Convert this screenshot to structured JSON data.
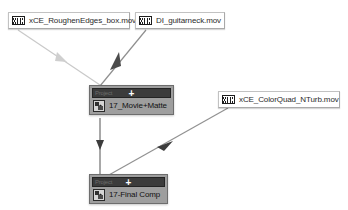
{
  "canvas": {
    "width": 348,
    "height": 210,
    "background": "#ffffff"
  },
  "flowchart": {
    "title": "After Effects composition flowchart",
    "colors": {
      "wire_light": "#c8c8c8",
      "wire_dark": "#6e6e6e",
      "comp_body": "#9e9e9e",
      "comp_titlebar": "#3b3b3b",
      "footage_background": "#ffffff",
      "label_text": "#2b2b2b"
    },
    "footage_nodes": [
      {
        "id": "roughen-edges",
        "label": "xCE_RoughenEdges_box.mov",
        "icon": "film-strip-icon",
        "x": 8,
        "y": 12,
        "width": 122,
        "height": 17
      },
      {
        "id": "guitarneck",
        "label": "DI_guitarneck.mov",
        "icon": "film-strip-icon",
        "x": 135,
        "y": 12,
        "width": 90,
        "height": 17
      },
      {
        "id": "colorquad",
        "label": "xCE_ColorQuad_NTurb.mov",
        "icon": "film-strip-icon",
        "x": 218,
        "y": 91,
        "width": 122,
        "height": 17
      }
    ],
    "comp_nodes": [
      {
        "id": "movie-matte",
        "label": "17_Movie+Matte",
        "titlebar_text": "Project",
        "plus": "+",
        "icon": "composition-thumbnail-icon",
        "x": 89,
        "y": 85,
        "width": 85,
        "height": 33
      },
      {
        "id": "final-comp",
        "label": "17-Final Comp",
        "titlebar_text": "Project",
        "plus": "+",
        "icon": "composition-thumbnail-icon",
        "x": 89,
        "y": 174,
        "width": 79,
        "height": 33
      }
    ],
    "connections": [
      {
        "id": "roughen-to-movie",
        "from": "roughen-edges",
        "to": "movie-matte",
        "style": "light"
      },
      {
        "id": "guitarneck-to-movie",
        "from": "guitarneck",
        "to": "movie-matte",
        "style": "dark"
      },
      {
        "id": "movie-to-final",
        "from": "movie-matte",
        "to": "final-comp",
        "style": "dark"
      },
      {
        "id": "colorquad-to-final",
        "from": "colorquad",
        "to": "final-comp",
        "style": "dark"
      }
    ]
  }
}
